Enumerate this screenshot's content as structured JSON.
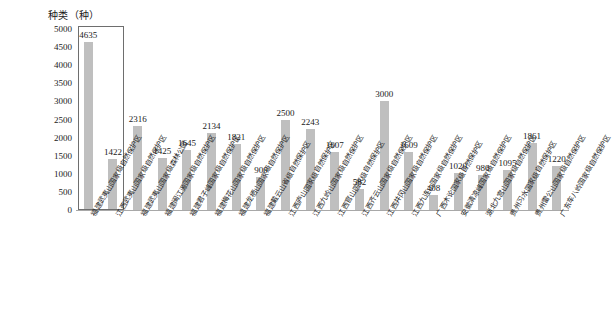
{
  "chart_data": {
    "type": "bar",
    "title": "",
    "ylabel": "种类（种）",
    "xlabel": "",
    "ylim": [
      0,
      5000
    ],
    "ytick_step": 500,
    "yticks": [
      "5000",
      "4500",
      "4000",
      "3500",
      "3000",
      "2500",
      "2000",
      "1500",
      "1000",
      "500",
      "0"
    ],
    "grid": false,
    "legend": "none",
    "bar_color": "#bfbfbf",
    "highlight_color": "#6e6e6e",
    "highlight_range": [
      0,
      1
    ],
    "categories": [
      "福建武夷山国家级自然保护区",
      "江西武夷山国家级自然保护区",
      "福建武夷山国家级森林公园",
      "福建闽江源国家级自然保护区",
      "福建君子峰国家级自然保护区",
      "福建梅花山国家级自然保护区",
      "福建龙栖山国家级自然保护区",
      "福建戴云山省级自然保护区",
      "江西庐山国家级自然保护区",
      "江西九岭山国家级自然保护区",
      "江西官山国家级自然保护区",
      "江西齐云山国家级自然保护区",
      "江西井冈山国家级自然保护区",
      "江西九连山国家级自然保护区",
      "广西木论国家级自然保护区",
      "安徽清凉峰国家级自然保护区",
      "湖北九宫山国家级自然保护区",
      "贵州习水国家级自然保护区",
      "贵州雷公山国家级自然保护区",
      "广东车八岭国家级自然保护区"
    ],
    "values": [
      4635,
      1422,
      2316,
      1425,
      1645,
      2134,
      1821,
      900,
      2500,
      2243,
      1607,
      582,
      3000,
      1609,
      408,
      1020,
      980,
      1095,
      1861,
      1220
    ],
    "value_labels": [
      "4635",
      "1422",
      "2316",
      "1425",
      "1645",
      "2134",
      "1821",
      "900",
      "2500",
      "2243",
      "1607",
      "582",
      "3000",
      "1609",
      "408",
      "1020",
      "980",
      "1095",
      "1861",
      "1220"
    ]
  }
}
